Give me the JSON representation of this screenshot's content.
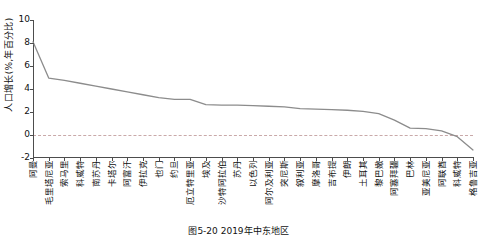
{
  "chart_data": {
    "type": "line",
    "title": "",
    "xlabel": "",
    "ylabel": "人口增长(%,年百分比)",
    "ylim": [
      -2,
      10
    ],
    "yticks": [
      10,
      8,
      6,
      4,
      2,
      0,
      -2
    ],
    "ytick_labels": [
      "10",
      "8",
      "6",
      "4",
      "2",
      "0",
      "-2"
    ],
    "grid": false,
    "legend": "none",
    "zero_reference_line": true,
    "zero_reference_value": 0,
    "line_color": "#8c8c8c",
    "zero_line_color": "#c9a9a9",
    "axis_color": "#4d4d4d",
    "categories": [
      "阿曼",
      "毛里塔尼亚",
      "索马里",
      "科威特",
      "南苏丹",
      "卡塔尔",
      "阿富汗",
      "伊拉克",
      "也门",
      "约旦",
      "厄立特里亚",
      "埃及",
      "沙特阿拉伯",
      "苏丹",
      "以色列",
      "阿尔及利亚",
      "突尼斯",
      "叙利亚",
      "摩洛哥",
      "吉布提",
      "伊朗",
      "土耳其",
      "黎巴嫩",
      "阿塞拜疆",
      "巴林",
      "亚美尼亚",
      "阿联酋",
      "科威特",
      "格鲁吉亚"
    ],
    "values": [
      8.1,
      4.95,
      4.75,
      4.5,
      4.25,
      4.0,
      3.75,
      3.5,
      3.25,
      3.1,
      3.1,
      2.65,
      2.6,
      2.6,
      2.55,
      2.5,
      2.45,
      2.3,
      2.25,
      2.2,
      2.15,
      2.05,
      1.85,
      1.3,
      0.6,
      0.55,
      0.35,
      -0.15,
      -1.3
    ],
    "caption": "图5-20  2019年中东地区"
  }
}
